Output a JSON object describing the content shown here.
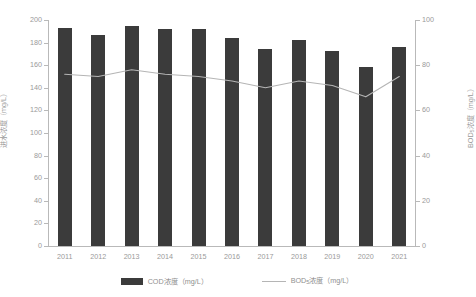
{
  "chart_data": {
    "type": "bar",
    "title": "",
    "xlabel": "",
    "ylabel": "进水浓度（mg/L）",
    "ylabel_right": "BOD₅浓度（mg/L）",
    "categories": [
      "2011",
      "2012",
      "2013",
      "2014",
      "2015",
      "2016",
      "2017",
      "2018",
      "2019",
      "2020",
      "2021"
    ],
    "ylim": [
      0,
      200
    ],
    "ylim_right": [
      0,
      100
    ],
    "yticks": [
      0,
      20,
      40,
      60,
      80,
      100,
      120,
      140,
      160,
      180,
      200
    ],
    "yticks_right": [
      0,
      20,
      40,
      60,
      80,
      100
    ],
    "grid": false,
    "legend_position": "bottom",
    "series": [
      {
        "name": "COD浓度（mg/L）",
        "type": "bar",
        "axis": "left",
        "color": "#3b3b3b",
        "values": [
          193,
          187,
          195,
          192,
          192,
          184,
          174,
          182,
          173,
          158,
          176
        ]
      },
      {
        "name": "BOD₅浓度（mg/L）",
        "type": "line",
        "axis": "right",
        "color": "#b5b5b5",
        "values": [
          76,
          75,
          78,
          76,
          75,
          73,
          70,
          73,
          71,
          66,
          75
        ]
      }
    ]
  },
  "axes": {
    "left_title": "进水浓度（mg/L）",
    "right_title_main": "BOD",
    "right_title_sub": "5",
    "right_title_tail": "浓度（mg/L）",
    "left_ticks": [
      "200",
      "180",
      "160",
      "140",
      "120",
      "100",
      "80",
      "60",
      "40",
      "20",
      "0"
    ],
    "right_ticks": [
      "100",
      "80",
      "60",
      "40",
      "20",
      "0"
    ],
    "x_ticks": [
      "2011",
      "2012",
      "2013",
      "2014",
      "2015",
      "2016",
      "2017",
      "2018",
      "2019",
      "2020",
      "2021"
    ]
  },
  "legend": {
    "items": [
      {
        "label": "COD浓度（mg/L）",
        "marker": "bar-swatch",
        "color": "#3b3b3b"
      },
      {
        "label_main": "BOD",
        "label_sub": "5",
        "label_tail": "浓度（mg/L）",
        "marker": "line-swatch",
        "color": "#b5b5b5"
      }
    ]
  }
}
